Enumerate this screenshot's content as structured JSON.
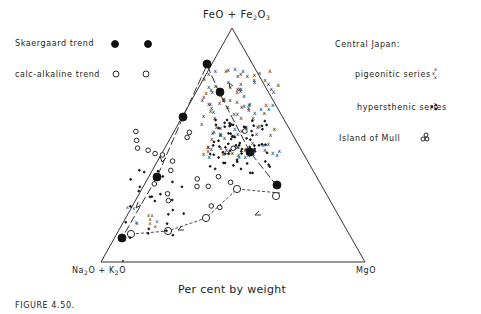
{
  "figure": {
    "caption": "FIGURE 4.50.",
    "xlabel": "Per cent by weight"
  },
  "legend": {
    "skaergaard": "Skaergaard trend",
    "calc_alkaline": "calc-alkaline trend",
    "central_japan": "Central Japan:",
    "pigeonitic": "pigeonitic series",
    "hypersthenic": "hypersthenic series",
    "mull": "Island of Mull"
  },
  "apex": {
    "top_a": "FeO + Fe",
    "top_sub1": "2",
    "top_b": "O",
    "top_sub2": "3",
    "left_a": "Na",
    "left_sub1": "2",
    "left_b": "O + K",
    "left_sub2": "2",
    "left_c": "O",
    "right": "MgO"
  },
  "chart_data": {
    "type": "scatter",
    "subtype": "ternary (AFM diagram)",
    "title": "",
    "caption": "FIGURE 4.50.",
    "xlabel": "Per cent by weight",
    "vertices": {
      "top": "FeO + Fe2O3",
      "bottom_left": "Na2O + K2O",
      "bottom_right": "MgO"
    },
    "legend": [
      "Skaergaard trend (filled circles)",
      "calc-alkaline trend (open circles)",
      "Central Japan: pigeonitic series (x)",
      "Central Japan: hypersthenic series (dots)",
      "Island of Mull (open circles)"
    ],
    "series": [
      {
        "name": "Skaergaard trend",
        "marker": "filled-circle",
        "line": "long-dash with arrows",
        "points_xy": [
          [
            277,
            185
          ],
          [
            250,
            152
          ],
          [
            220,
            92
          ],
          [
            207,
            64
          ],
          [
            183,
            117
          ],
          [
            157,
            177
          ],
          [
            122,
            238
          ]
        ]
      },
      {
        "name": "calc-alkaline trend",
        "marker": "open-circle",
        "line": "short-dash with arrows",
        "points_xy": [
          [
            276,
            196
          ],
          [
            237,
            189
          ],
          [
            206,
            218
          ],
          [
            168,
            231
          ],
          [
            131,
            234
          ]
        ]
      },
      {
        "name": "Central Japan: pigeonitic series",
        "marker": "x",
        "region": "central upper field, FeO-rich"
      },
      {
        "name": "Central Japan: hypersthenic series",
        "marker": "dot",
        "region": "central field, MgO-richer"
      },
      {
        "name": "Island of Mull",
        "marker": "open-circle",
        "region": "scattered along left/center"
      }
    ],
    "grid": false,
    "legend_position": "left and right of triangle"
  }
}
